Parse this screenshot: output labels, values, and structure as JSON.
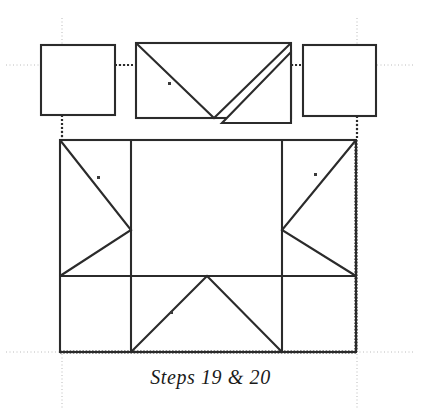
{
  "figure": {
    "caption": "Steps 19 & 20",
    "type": "folding-instruction-diagram",
    "canvas": {
      "width": 421,
      "height": 419,
      "background": "#ffffff"
    }
  },
  "colors": {
    "stroke": "#2b2b2b",
    "guide": "#b9b9b9",
    "fold_dot": "#3a3a3a",
    "fill": "#ffffff",
    "caption": "#1a1a1a"
  },
  "strokes": {
    "solid_width": 2.1,
    "guide_width": 1.0,
    "dotted_width": 2.2,
    "hatched_width": 3.2
  },
  "shapes": {
    "top_left_square": {
      "name": "plain square",
      "x": 41,
      "y": 45,
      "width": 74,
      "height": 70,
      "diagonals": []
    },
    "top_middle_rect": {
      "name": "rectangle with V fold and detached triangle",
      "x": 136,
      "y": 43,
      "width": 155,
      "height": 75,
      "v_fold": {
        "from_x": 136,
        "from_y": 43,
        "apex_x": 214,
        "apex_y": 118,
        "to_x": 291,
        "to_y": 43
      },
      "detached_triangle": {
        "p1_x": 222,
        "p1_y": 123,
        "p2_x": 291,
        "p2_y": 123,
        "p3_x": 291,
        "p3_y": 52
      }
    },
    "top_right_square": {
      "name": "plain square",
      "x": 303,
      "y": 45,
      "width": 73,
      "height": 71,
      "diagonals": []
    },
    "main_rect": {
      "name": "main body rectangle",
      "x": 60,
      "y": 140,
      "width": 296,
      "height": 212,
      "vertical_dividers_x": [
        131,
        282
      ],
      "horizontal_divider_y": 276,
      "left_arrow": {
        "top_x": 60,
        "top_y": 140,
        "tip_x": 131,
        "tip_y": 230,
        "bottom_x": 60,
        "bottom_y": 276
      },
      "right_arrow": {
        "top_x": 356,
        "top_y": 140,
        "tip_x": 282,
        "tip_y": 230,
        "bottom_x": 356,
        "bottom_y": 276
      },
      "bottom_peak": {
        "left_x": 131,
        "left_y": 352,
        "apex_x": 207,
        "apex_y": 276,
        "right_x": 282,
        "right_y": 352
      }
    }
  },
  "guides": {
    "vertical": [
      {
        "x": 62,
        "y1": 18,
        "y2": 408
      },
      {
        "x": 357,
        "y1": 18,
        "y2": 408
      }
    ],
    "horizontal": [
      {
        "y": 65,
        "x1": 6,
        "x2": 415
      },
      {
        "y": 352,
        "x1": 6,
        "x2": 415
      }
    ]
  },
  "dotted_connectors": {
    "horizontal": [
      {
        "x1": 115,
        "x2": 136,
        "y": 65
      },
      {
        "x1": 291,
        "x2": 303,
        "y": 65
      }
    ],
    "vertical": [
      {
        "x": 62,
        "y1": 115,
        "y2": 140
      },
      {
        "x": 357,
        "y1": 116,
        "y2": 140
      }
    ]
  },
  "hatched_edges": {
    "right": {
      "x": 356,
      "y1": 140,
      "y2": 352
    },
    "bottom": {
      "y": 352,
      "x1": 60,
      "x2": 356
    }
  },
  "fold_markers": [
    {
      "x": 99,
      "y": 178,
      "on": "left-panel-upper-diagonal"
    },
    {
      "x": 316,
      "y": 175,
      "on": "right-panel-upper-diagonal"
    },
    {
      "x": 170,
      "y": 84,
      "on": "middle-rect-left-diagonal"
    },
    {
      "x": 172,
      "y": 313,
      "on": "bottom-peak-left-diagonal"
    }
  ]
}
